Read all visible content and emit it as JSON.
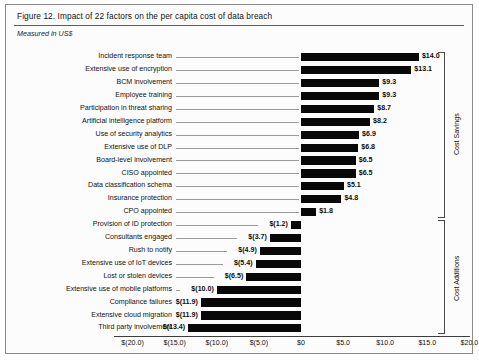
{
  "figure": {
    "title": "Figure 12. Impact of 22 factors on the per capita cost of data breach",
    "subtitle": "Measured in US$"
  },
  "brackets": [
    {
      "label": "Cost Savings"
    },
    {
      "label": "Cost Additions"
    }
  ],
  "chart_data": {
    "type": "bar",
    "orientation": "horizontal",
    "title": "Figure 12. Impact of 22 factors on the per capita cost of data breach",
    "subtitle": "Measured in US$",
    "xlabel": "",
    "ylabel": "",
    "xlim": [
      -20.0,
      20.0
    ],
    "xticks": [
      -20.0,
      -15.0,
      -10.0,
      -5.0,
      0,
      5.0,
      10.0,
      15.0,
      20.0
    ],
    "xticklabels": [
      "$(20.0)",
      "$(15.0)",
      "$(10.0)",
      "$(5.0)",
      "$0",
      "$5.0",
      "$10.0",
      "$15.0",
      "$20.0"
    ],
    "grid": false,
    "legend": null,
    "bar_color": "#080808",
    "categories": [
      "Incident response team",
      "Extensive use of encryption",
      "BCM involvement",
      "Employee training",
      "Participation in threat sharing",
      "Artificial intelligence platform",
      "Use of security analytics",
      "Extensive use of DLP",
      "Board-level involvement",
      "CISO appointed",
      "Data classification schema",
      "Insurance protection",
      "CPO appointed",
      "Provision of ID protection",
      "Consultants engaged",
      "Rush to notify",
      "Extensive use of IoT devices",
      "Lost or stolen devices",
      "Extensive use of mobile platforms",
      "Compliance failures",
      "Extensive cloud migration",
      "Third party involvement"
    ],
    "values": [
      14.0,
      13.1,
      9.3,
      9.3,
      8.7,
      8.2,
      6.9,
      6.8,
      6.5,
      6.5,
      5.1,
      4.8,
      1.8,
      -1.2,
      -3.7,
      -4.9,
      -5.4,
      -6.5,
      -10.0,
      -11.9,
      -11.9,
      -13.4
    ],
    "value_labels": [
      "$14.0",
      "$13.1",
      "$9.3",
      "$9.3",
      "$8.7",
      "$8.2",
      "$6.9",
      "$6.8",
      "$6.5",
      "$6.5",
      "$5.1",
      "$4.8",
      "$1.8",
      "$(1.2)",
      "$(3.7)",
      "$(4.9)",
      "$(5.4)",
      "$(6.5)",
      "$(10.0)",
      "$(11.9)",
      "$(11.9)",
      "$(13.4)"
    ],
    "groups": [
      {
        "name": "Cost Savings",
        "from_index": 0,
        "to_index": 12
      },
      {
        "name": "Cost Additions",
        "from_index": 13,
        "to_index": 21
      }
    ]
  }
}
